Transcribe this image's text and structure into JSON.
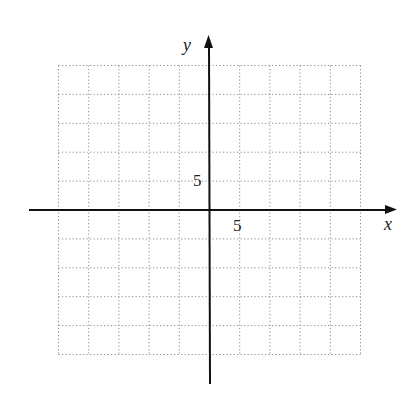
{
  "chart_data": {
    "type": "scatter",
    "title": "",
    "xlabel": "x",
    "ylabel": "y",
    "xlim": [
      -25,
      25
    ],
    "ylim": [
      -25,
      25
    ],
    "grid": true,
    "grid_style": "dotted",
    "grid_spacing": 5,
    "tick_labels": {
      "x": [
        "5"
      ],
      "y": [
        "5"
      ]
    },
    "series": []
  },
  "axes": {
    "x_label": "x",
    "y_label": "y",
    "x_tick_label": "5",
    "y_tick_label": "5"
  },
  "colors": {
    "axis": "#111111",
    "grid": "#8a8a8a",
    "text": "#222222"
  }
}
